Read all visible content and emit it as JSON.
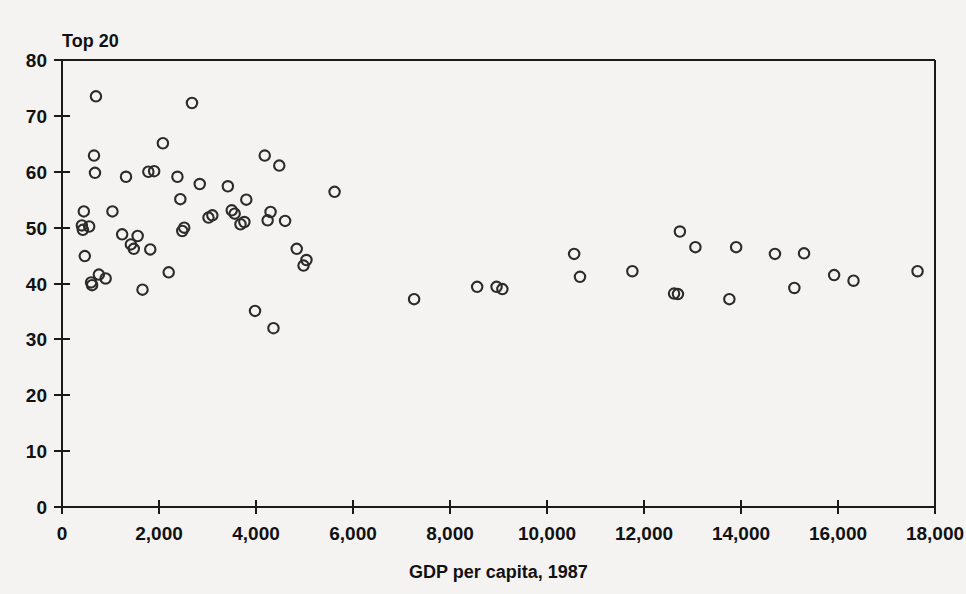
{
  "chart_data": {
    "type": "scatter",
    "title": "Top 20",
    "xlabel": "GDP per capita, 1987",
    "ylabel": "",
    "xlim": [
      0,
      18000
    ],
    "ylim": [
      0,
      80
    ],
    "grid": false,
    "legend": null,
    "marker": {
      "shape": "open-circle",
      "radius": 5.2,
      "stroke": "#2b2b2b",
      "fill": "none"
    },
    "xticks": [
      0,
      2000,
      4000,
      6000,
      8000,
      10000,
      12000,
      14000,
      16000,
      18000
    ],
    "xticklabels": [
      "0",
      "2,000",
      "4,000",
      "6,000",
      "8,000",
      "10,000",
      "12,000",
      "14,000",
      "16,000",
      "18,000"
    ],
    "yticks": [
      0,
      10,
      20,
      30,
      40,
      50,
      60,
      70,
      80
    ],
    "yticklabels": [
      "0",
      "10",
      "20",
      "30",
      "40",
      "50",
      "60",
      "70",
      "80"
    ],
    "points": [
      [
        410,
        50.4
      ],
      [
        430,
        49.6
      ],
      [
        450,
        52.9
      ],
      [
        470,
        44.9
      ],
      [
        560,
        50.2
      ],
      [
        600,
        40.2
      ],
      [
        620,
        39.7
      ],
      [
        660,
        62.9
      ],
      [
        680,
        59.8
      ],
      [
        700,
        73.5
      ],
      [
        760,
        41.6
      ],
      [
        900,
        40.9
      ],
      [
        1040,
        52.9
      ],
      [
        1240,
        48.8
      ],
      [
        1320,
        59.1
      ],
      [
        1420,
        47.0
      ],
      [
        1480,
        46.2
      ],
      [
        1560,
        48.5
      ],
      [
        1660,
        38.9
      ],
      [
        1780,
        60.0
      ],
      [
        1820,
        46.1
      ],
      [
        1900,
        60.1
      ],
      [
        2080,
        65.1
      ],
      [
        2200,
        42.0
      ],
      [
        2380,
        59.1
      ],
      [
        2440,
        55.1
      ],
      [
        2480,
        49.4
      ],
      [
        2520,
        50.0
      ],
      [
        2680,
        72.3
      ],
      [
        2840,
        57.8
      ],
      [
        3020,
        51.8
      ],
      [
        3100,
        52.2
      ],
      [
        3420,
        57.4
      ],
      [
        3500,
        53.1
      ],
      [
        3560,
        52.5
      ],
      [
        3680,
        50.6
      ],
      [
        3760,
        51.0
      ],
      [
        3800,
        55.0
      ],
      [
        3980,
        35.1
      ],
      [
        4180,
        62.9
      ],
      [
        4240,
        51.3
      ],
      [
        4300,
        52.8
      ],
      [
        4360,
        32.0
      ],
      [
        4480,
        61.1
      ],
      [
        4600,
        51.2
      ],
      [
        4840,
        46.2
      ],
      [
        4980,
        43.2
      ],
      [
        5040,
        44.2
      ],
      [
        5620,
        56.4
      ],
      [
        7260,
        37.2
      ],
      [
        8560,
        39.4
      ],
      [
        8960,
        39.4
      ],
      [
        9080,
        39.0
      ],
      [
        10560,
        45.3
      ],
      [
        10680,
        41.2
      ],
      [
        11760,
        42.2
      ],
      [
        12620,
        38.2
      ],
      [
        12700,
        38.1
      ],
      [
        12740,
        49.3
      ],
      [
        13060,
        46.5
      ],
      [
        13760,
        37.2
      ],
      [
        13900,
        46.5
      ],
      [
        14700,
        45.3
      ],
      [
        15100,
        39.2
      ],
      [
        15300,
        45.4
      ],
      [
        15920,
        41.5
      ],
      [
        16320,
        40.5
      ],
      [
        17640,
        42.2
      ]
    ]
  }
}
